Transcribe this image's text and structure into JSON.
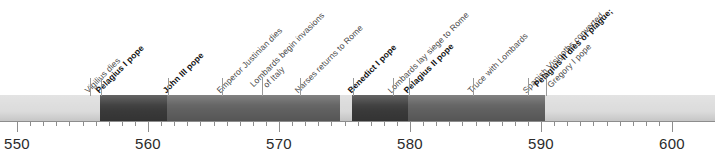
{
  "figure": {
    "type": "timeline",
    "title": "",
    "axis": {
      "start_year": 550,
      "end_year": 600,
      "px_per_year": 13.1,
      "origin_px": 17,
      "major_interval": 10,
      "minor_interval": 1,
      "major_ticks": [
        {
          "year": 550,
          "label": "550"
        },
        {
          "year": 560,
          "label": "560"
        },
        {
          "year": 570,
          "label": "570"
        },
        {
          "year": 580,
          "label": "580"
        },
        {
          "year": 590,
          "label": "590"
        },
        {
          "year": 600,
          "label": "600"
        }
      ]
    },
    "bar_segments": [
      {
        "name": "pre-pelagius-i",
        "start_px": 0,
        "end_px": 100,
        "color": "#dcdcdc"
      },
      {
        "name": "pelagius-i-reign",
        "start_px": 100,
        "end_px": 167,
        "color": "#393939"
      },
      {
        "name": "john-iii-reign",
        "start_px": 167,
        "end_px": 340,
        "color": "#5f5f5f"
      },
      {
        "name": "sede-vacante-gap",
        "start_px": 340,
        "end_px": 352,
        "color": "#d9d9d9"
      },
      {
        "name": "benedict-i-reign",
        "start_px": 352,
        "end_px": 408,
        "color": "#393939"
      },
      {
        "name": "pelagius-ii-reign",
        "start_px": 408,
        "end_px": 545,
        "color": "#5f5f5f"
      },
      {
        "name": "gregory-i-reign",
        "start_px": 545,
        "end_px": 715,
        "color": "#dcdcdc"
      }
    ],
    "events": [
      {
        "id": "vigilius-dies",
        "anchor_px": 90,
        "style": "normal",
        "lines": [
          {
            "text": "Vigilius dies",
            "weight": "normal"
          }
        ]
      },
      {
        "id": "pelagius-i-pope",
        "anchor_px": 101,
        "style": "bold",
        "lines": [
          {
            "text": "Pelagius I pope",
            "weight": "bold"
          }
        ]
      },
      {
        "id": "john-iii-pope",
        "anchor_px": 168,
        "style": "bold",
        "lines": [
          {
            "text": "John III pope",
            "weight": "bold"
          }
        ]
      },
      {
        "id": "justinian-dies",
        "anchor_px": 222,
        "style": "normal",
        "lines": [
          {
            "text": "Emperor Justinian dies",
            "weight": "normal"
          }
        ]
      },
      {
        "id": "lombards-invade",
        "anchor_px": 262,
        "style": "normal",
        "lines": [
          {
            "text": "Lombards begin invasions",
            "weight": "normal"
          },
          {
            "text": "of Italy",
            "weight": "normal",
            "indent": true
          }
        ]
      },
      {
        "id": "narses-returns",
        "anchor_px": 300,
        "style": "normal",
        "lines": [
          {
            "text": "Narses returns to Rome",
            "weight": "normal"
          }
        ]
      },
      {
        "id": "benedict-i-pope",
        "anchor_px": 353,
        "style": "bold",
        "lines": [
          {
            "text": "Benedict I pope",
            "weight": "bold"
          }
        ]
      },
      {
        "id": "lombards-siege-rome",
        "anchor_px": 393,
        "style": "normal",
        "lines": [
          {
            "text": "Lombards lay siege to Rome",
            "weight": "normal"
          }
        ]
      },
      {
        "id": "pelagius-ii-pope",
        "anchor_px": 409,
        "style": "bold",
        "lines": [
          {
            "text": "Pelagius II pope",
            "weight": "bold"
          }
        ]
      },
      {
        "id": "truce-with-lombards",
        "anchor_px": 473,
        "style": "normal",
        "lines": [
          {
            "text": "Truce with Lombards",
            "weight": "normal"
          }
        ]
      },
      {
        "id": "visigoths-converted",
        "anchor_px": 528,
        "style": "normal",
        "lines": [
          {
            "text": "Spanish Visigoths converted",
            "weight": "normal"
          }
        ]
      },
      {
        "id": "pelagius-ii-dies",
        "anchor_px": 546,
        "style": "bold",
        "lines": [
          {
            "text": "Pelagius II dies of plague;",
            "weight": "bold"
          },
          {
            "text": "Gregory I pope",
            "weight": "normal",
            "indent": true
          }
        ]
      }
    ]
  }
}
